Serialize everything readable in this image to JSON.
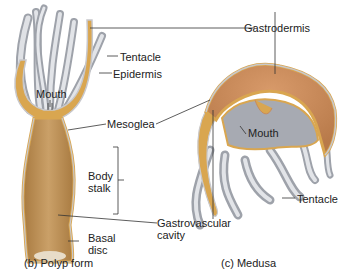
{
  "figure": {
    "polyp": {
      "caption": "(b)  Polyp form",
      "labels": {
        "tentacle": "Tentacle",
        "epidermis": "Epidermis",
        "mouth": "Mouth",
        "mesoglea": "Mesoglea",
        "body_stalk_line1": "Body",
        "body_stalk_line2": "stalk",
        "basal_disc_line1": "Basal",
        "basal_disc_line2": "disc"
      }
    },
    "medusa": {
      "caption": "(c)  Medusa",
      "labels": {
        "gastrodermis": "Gastrodermis",
        "mouth": "Mouth",
        "tentacle": "Tentacle"
      }
    },
    "shared_labels": {
      "gastrovascular_line1": "Gastrovascular",
      "gastrovascular_line2": "cavity"
    },
    "colors": {
      "mesoglea": "#d9a650",
      "gastro": "#c98b5a",
      "cavity": "#b88a55",
      "epidermis": "#c8c8cc",
      "tentacle": "#b9bcc2",
      "line": "#333333"
    }
  }
}
